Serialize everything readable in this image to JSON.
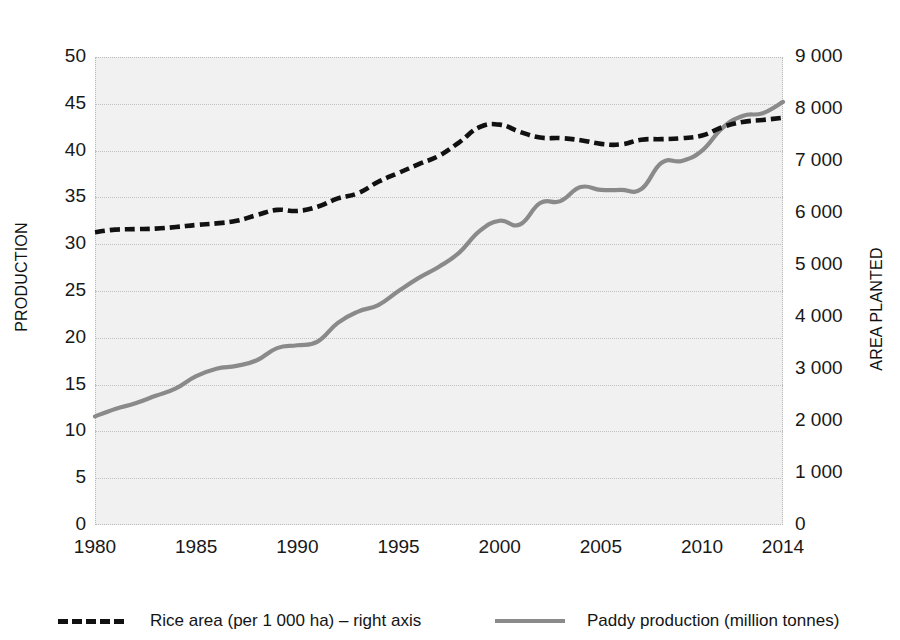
{
  "chart_data": {
    "type": "line",
    "title": "",
    "subtitle": "",
    "xlabel": "",
    "ylabel": "PRODUCTION",
    "y2label": "AREA PLANTED",
    "grid": true,
    "legend_position": "bottom",
    "x": [
      1980,
      1981,
      1982,
      1983,
      1984,
      1985,
      1986,
      1987,
      1988,
      1989,
      1990,
      1991,
      1992,
      1993,
      1994,
      1995,
      1996,
      1997,
      1998,
      1999,
      2000,
      2001,
      2002,
      2003,
      2004,
      2005,
      2006,
      2007,
      2008,
      2009,
      2010,
      2011,
      2012,
      2013,
      2014
    ],
    "x_tick_labels": [
      "1980",
      "1985",
      "1990",
      "1995",
      "2000",
      "2005",
      "2010",
      "2014"
    ],
    "x_tick_values": [
      1980,
      1985,
      1990,
      1995,
      2000,
      2005,
      2010,
      2014
    ],
    "xlim": [
      1980,
      2014
    ],
    "ylim": [
      0,
      50
    ],
    "y_tick_labels": [
      "0",
      "5",
      "10",
      "15",
      "20",
      "25",
      "30",
      "35",
      "40",
      "45",
      "50"
    ],
    "y_tick_values": [
      0,
      5,
      10,
      15,
      20,
      25,
      30,
      35,
      40,
      45,
      50
    ],
    "y2lim": [
      0,
      9000
    ],
    "y2_tick_labels": [
      "0",
      "1 000",
      "2 000",
      "3 000",
      "4 000",
      "5 000",
      "6 000",
      "7 000",
      "8 000",
      "9 000"
    ],
    "y2_tick_values": [
      0,
      1000,
      2000,
      3000,
      4000,
      5000,
      6000,
      7000,
      8000,
      9000
    ],
    "series": [
      {
        "name": "Rice area (per 1 000 ha) – right axis",
        "axis": "right",
        "style": "dashed",
        "color": "#111111",
        "values": [
          5630,
          5680,
          5690,
          5700,
          5730,
          5770,
          5800,
          5850,
          5960,
          6060,
          6040,
          6120,
          6280,
          6380,
          6600,
          6770,
          6940,
          7100,
          7360,
          7650,
          7700,
          7560,
          7450,
          7440,
          7400,
          7330,
          7320,
          7410,
          7420,
          7440,
          7490,
          7650,
          7750,
          7790,
          7830
        ]
      },
      {
        "name": "Paddy production (million tonnes)",
        "axis": "left",
        "style": "solid",
        "color": "#8a8a8a",
        "values": [
          11.6,
          12.4,
          13.0,
          13.8,
          14.6,
          15.9,
          16.7,
          17.0,
          17.6,
          18.9,
          19.2,
          19.6,
          21.6,
          22.8,
          23.5,
          25.0,
          26.4,
          27.6,
          29.1,
          31.4,
          32.5,
          32.1,
          34.4,
          34.6,
          36.1,
          35.8,
          35.8,
          35.9,
          38.7,
          38.9,
          40.0,
          42.4,
          43.7,
          44.0,
          45.2
        ]
      }
    ]
  },
  "bleed_text": [
    {
      "x": 120,
      "y": 60,
      "text": "in the sector. Rice production and yields have shown"
    },
    {
      "x": 420,
      "y": 60,
      "text": "steady increases over the years"
    },
    {
      "x": 120,
      "y": 84,
      "text": "with the area planted expanding to meet rising demand"
    },
    {
      "x": 120,
      "y": 138,
      "text": "by the government through subsidies and support"
    },
    {
      "x": 120,
      "y": 300,
      "text": "and the national rice self-sufficiency programme"
    },
    {
      "x": 120,
      "y": 420,
      "text": "has been a policy priority since the early years"
    },
    {
      "x": 120,
      "y": 450,
      "text": "and domestic demand for the staple continues to grow"
    },
    {
      "x": 120,
      "y": 480,
      "text": "with milling capacity and logistics infrastructure"
    }
  ],
  "legend": {
    "items": [
      {
        "label": "Rice area (per 1 000 ha) – right axis",
        "style": "dashed"
      },
      {
        "label": "Paddy production (million tonnes)",
        "style": "solid"
      }
    ]
  },
  "colors": {
    "area_series": "#111111",
    "production_series": "#8a8a8a",
    "plot_background": "#f1f1f1",
    "gridline": "#c2c2c2",
    "text": "#181818"
  }
}
